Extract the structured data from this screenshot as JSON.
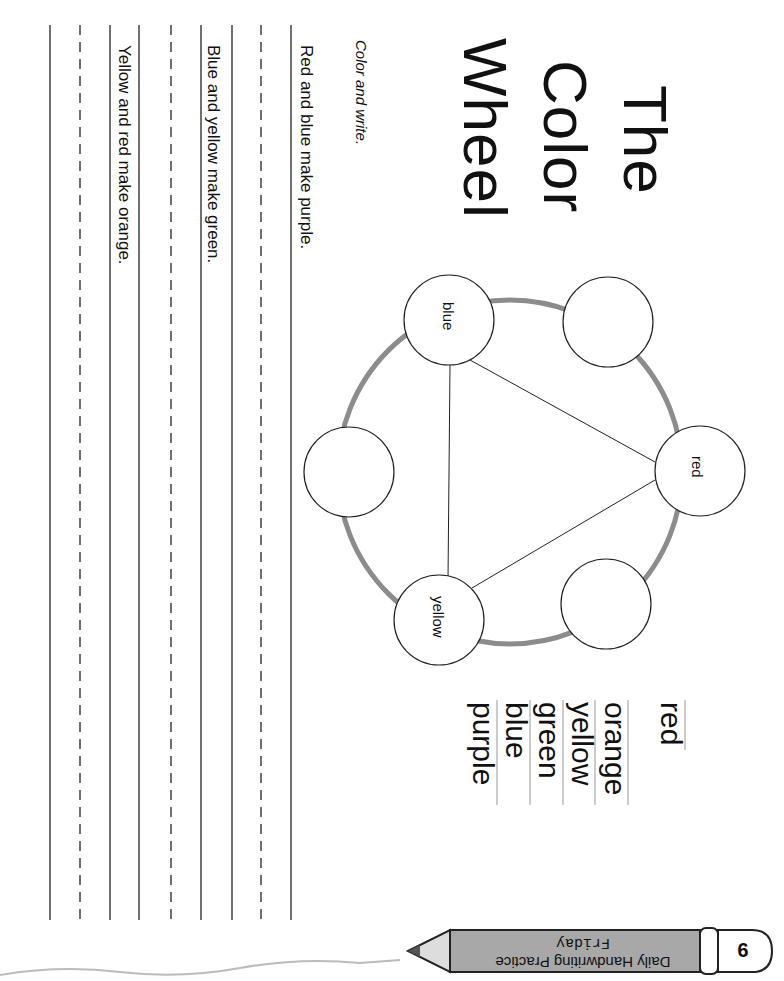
{
  "title": {
    "line1": "The",
    "line2": "Color",
    "line3": "Wheel"
  },
  "instruction": "Color and write.",
  "sentences": [
    "Red and blue make purple.",
    "Blue and yellow make green.",
    "Yellow and red make orange."
  ],
  "word_list": [
    "red",
    "orange",
    "yellow",
    "green",
    "blue",
    "purple"
  ],
  "wheel": {
    "circles": [
      {
        "label": "red"
      },
      {
        "label": ""
      },
      {
        "label": "blue"
      },
      {
        "label": ""
      },
      {
        "label": "yellow"
      },
      {
        "label": ""
      }
    ],
    "ring_color": "#8c8c8c"
  },
  "footer": {
    "series": "Daily Handwriting Practice",
    "day": "Friday",
    "page_number": "9",
    "pencil_color": "#a8a8a8"
  }
}
